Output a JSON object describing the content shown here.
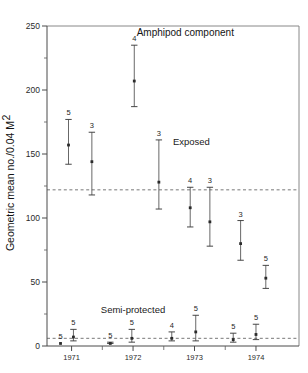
{
  "chart_data": {
    "type": "scatter",
    "title": "Amphipod component",
    "xlabel": "",
    "ylabel": "Geometric mean no./0.04 M",
    "ylabel_exponent": "2",
    "ylim": [
      0,
      250
    ],
    "xlim": [
      1970.6,
      1974.7
    ],
    "yticks": [
      0,
      50,
      100,
      150,
      200,
      250
    ],
    "ytick_labels": [
      "0",
      "50",
      "100",
      "150",
      "200",
      "250"
    ],
    "yticks_minor": [
      25,
      75,
      125,
      175,
      225
    ],
    "xticks": [
      1971,
      1972,
      1973,
      1974
    ],
    "xtick_labels": [
      "1971",
      "1972",
      "1973",
      "1974"
    ],
    "xticks_minor": [
      1971.5,
      1972.5,
      1973.5
    ],
    "grid": false,
    "legend_position": "inline-annotations",
    "annotations": [
      {
        "text": "Amphipod component",
        "x": 1972.85,
        "y": 242,
        "name": "chart-title"
      },
      {
        "text": "Exposed",
        "x": 1972.95,
        "y": 157,
        "name": "exposed-label"
      },
      {
        "text": "Semi-protected",
        "x": 1972.0,
        "y": 26,
        "name": "semi-protected-label"
      }
    ],
    "reference_lines": [
      {
        "name": "exposed-mean-line",
        "y": 122,
        "style": "dashed"
      },
      {
        "name": "semi-protected-mean-line",
        "y": 6,
        "style": "dashed"
      }
    ],
    "series": [
      {
        "name": "Exposed",
        "marker": "square",
        "points": [
          {
            "x": 1970.95,
            "y": 157,
            "low": 142,
            "high": 177,
            "n": "5"
          },
          {
            "x": 1971.33,
            "y": 144,
            "low": 118,
            "high": 167,
            "n": "3"
          },
          {
            "x": 1972.02,
            "y": 207,
            "low": 187,
            "high": 235,
            "n": "4"
          },
          {
            "x": 1972.42,
            "y": 128,
            "low": 107,
            "high": 161,
            "n": "3"
          },
          {
            "x": 1972.93,
            "y": 108,
            "low": 93,
            "high": 124,
            "n": "4"
          },
          {
            "x": 1973.25,
            "y": 97,
            "low": 78,
            "high": 124,
            "n": "3"
          },
          {
            "x": 1973.75,
            "y": 80,
            "low": 67,
            "high": 98,
            "n": "3"
          },
          {
            "x": 1974.16,
            "y": 53,
            "low": 45,
            "high": 63,
            "n": "5"
          }
        ]
      },
      {
        "name": "Semi-protected",
        "marker": "square",
        "points": [
          {
            "x": 1970.82,
            "y": 2,
            "low": 2,
            "high": 2,
            "n": "5"
          },
          {
            "x": 1971.03,
            "y": 7,
            "low": 4,
            "high": 13,
            "n": "5"
          },
          {
            "x": 1971.63,
            "y": 2,
            "low": 2,
            "high": 3,
            "n": "5"
          },
          {
            "x": 1971.98,
            "y": 6,
            "low": 3,
            "high": 13,
            "n": "5"
          },
          {
            "x": 1972.63,
            "y": 6,
            "low": 4,
            "high": 11,
            "n": "4"
          },
          {
            "x": 1973.02,
            "y": 11,
            "low": 4,
            "high": 24,
            "n": "5"
          },
          {
            "x": 1973.63,
            "y": 5,
            "low": 3,
            "high": 10,
            "n": "5"
          },
          {
            "x": 1974.0,
            "y": 9,
            "low": 5,
            "high": 17,
            "n": "5"
          }
        ]
      }
    ]
  }
}
